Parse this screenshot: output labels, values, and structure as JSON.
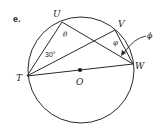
{
  "problem": {
    "label": "e."
  },
  "diagram": {
    "circle_center_label": "O",
    "points": {
      "T": "T",
      "U": "U",
      "V": "V",
      "W": "W"
    },
    "angles": {
      "theta": "θ",
      "thirty": "30°",
      "phi_inner": "φ",
      "phi_outer": "ϕ"
    },
    "colors": {
      "stroke": "#2a2a2a",
      "text": "#222222"
    }
  }
}
